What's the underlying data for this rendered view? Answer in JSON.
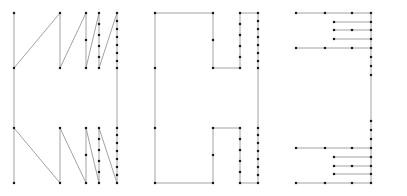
{
  "figure": {
    "title": "",
    "background_color": "#ffffff",
    "edge_color": "#8a8a8a",
    "node_color": "#1a1a1a",
    "node_size": 2.2,
    "edge_width": 0.8,
    "width": 407,
    "height": 196,
    "panel_count": 3
  },
  "chart_data": {
    "type": "scatter",
    "title": "",
    "xlabel": "",
    "ylabel": "",
    "grid": false,
    "legend": null,
    "xlim": [
      0,
      407
    ],
    "ylim": [
      0,
      196
    ],
    "panels": [
      {
        "name": "panel-left",
        "label": "",
        "nodes": [
          [
            14,
            13
          ],
          [
            14,
            68
          ],
          [
            14,
            128
          ],
          [
            14,
            183
          ],
          [
            60,
            13
          ],
          [
            60,
            68
          ],
          [
            60,
            128
          ],
          [
            60,
            183
          ],
          [
            86,
            13
          ],
          [
            86,
            40
          ],
          [
            86,
            68
          ],
          [
            86,
            128
          ],
          [
            86,
            155
          ],
          [
            86,
            183
          ],
          [
            99,
            13
          ],
          [
            99,
            24
          ],
          [
            99,
            35
          ],
          [
            99,
            46
          ],
          [
            99,
            57
          ],
          [
            99,
            68
          ],
          [
            99,
            128
          ],
          [
            99,
            139
          ],
          [
            99,
            150
          ],
          [
            99,
            161
          ],
          [
            99,
            172
          ],
          [
            99,
            183
          ],
          [
            117,
            13
          ],
          [
            117,
            21
          ],
          [
            117,
            29
          ],
          [
            117,
            37
          ],
          [
            117,
            45
          ],
          [
            117,
            53
          ],
          [
            117,
            61
          ],
          [
            117,
            68
          ],
          [
            117,
            128
          ],
          [
            117,
            135
          ],
          [
            117,
            143
          ],
          [
            117,
            151
          ],
          [
            117,
            159
          ],
          [
            117,
            167
          ],
          [
            117,
            175
          ],
          [
            117,
            183
          ]
        ],
        "edges": [
          [
            [
              14,
              13
            ],
            [
              14,
              68
            ]
          ],
          [
            [
              14,
              68
            ],
            [
              60,
              13
            ]
          ],
          [
            [
              60,
              13
            ],
            [
              60,
              68
            ]
          ],
          [
            [
              60,
              68
            ],
            [
              86,
              13
            ]
          ],
          [
            [
              86,
              13
            ],
            [
              86,
              68
            ]
          ],
          [
            [
              86,
              68
            ],
            [
              99,
              13
            ]
          ],
          [
            [
              99,
              13
            ],
            [
              99,
              68
            ]
          ],
          [
            [
              99,
              68
            ],
            [
              117,
              13
            ]
          ],
          [
            [
              117,
              13
            ],
            [
              117,
              68
            ]
          ],
          [
            [
              14,
              68
            ],
            [
              14,
              128
            ]
          ],
          [
            [
              117,
              68
            ],
            [
              117,
              128
            ]
          ],
          [
            [
              14,
              128
            ],
            [
              14,
              183
            ]
          ],
          [
            [
              14,
              128
            ],
            [
              60,
              183
            ]
          ],
          [
            [
              60,
              128
            ],
            [
              60,
              183
            ]
          ],
          [
            [
              60,
              128
            ],
            [
              86,
              183
            ]
          ],
          [
            [
              86,
              128
            ],
            [
              86,
              183
            ]
          ],
          [
            [
              86,
              128
            ],
            [
              99,
              183
            ]
          ],
          [
            [
              99,
              128
            ],
            [
              99,
              183
            ]
          ],
          [
            [
              99,
              128
            ],
            [
              117,
              183
            ]
          ],
          [
            [
              117,
              128
            ],
            [
              117,
              183
            ]
          ]
        ]
      },
      {
        "name": "panel-middle",
        "label": "",
        "nodes": [
          [
            155,
            13
          ],
          [
            155,
            68
          ],
          [
            155,
            128
          ],
          [
            155,
            183
          ],
          [
            213,
            13
          ],
          [
            213,
            40
          ],
          [
            213,
            68
          ],
          [
            213,
            128
          ],
          [
            213,
            155
          ],
          [
            213,
            183
          ],
          [
            240,
            13
          ],
          [
            240,
            24
          ],
          [
            240,
            35
          ],
          [
            240,
            46
          ],
          [
            240,
            57
          ],
          [
            240,
            68
          ],
          [
            240,
            128
          ],
          [
            240,
            139
          ],
          [
            240,
            150
          ],
          [
            240,
            161
          ],
          [
            240,
            172
          ],
          [
            240,
            183
          ],
          [
            258,
            13
          ],
          [
            258,
            21
          ],
          [
            258,
            29
          ],
          [
            258,
            37
          ],
          [
            258,
            45
          ],
          [
            258,
            53
          ],
          [
            258,
            61
          ],
          [
            258,
            68
          ],
          [
            258,
            128
          ],
          [
            258,
            135
          ],
          [
            258,
            143
          ],
          [
            258,
            151
          ],
          [
            258,
            159
          ],
          [
            258,
            167
          ],
          [
            258,
            175
          ],
          [
            258,
            183
          ]
        ],
        "edges": [
          [
            [
              155,
              13
            ],
            [
              213,
              13
            ]
          ],
          [
            [
              155,
              13
            ],
            [
              155,
              68
            ]
          ],
          [
            [
              213,
              13
            ],
            [
              213,
              68
            ]
          ],
          [
            [
              213,
              68
            ],
            [
              240,
              68
            ]
          ],
          [
            [
              240,
              13
            ],
            [
              258,
              13
            ]
          ],
          [
            [
              240,
              13
            ],
            [
              240,
              68
            ]
          ],
          [
            [
              258,
              13
            ],
            [
              258,
              68
            ]
          ],
          [
            [
              155,
              68
            ],
            [
              155,
              128
            ]
          ],
          [
            [
              258,
              68
            ],
            [
              258,
              128
            ]
          ],
          [
            [
              155,
              183
            ],
            [
              213,
              183
            ]
          ],
          [
            [
              155,
              128
            ],
            [
              155,
              183
            ]
          ],
          [
            [
              213,
              128
            ],
            [
              213,
              183
            ]
          ],
          [
            [
              213,
              128
            ],
            [
              240,
              128
            ]
          ],
          [
            [
              240,
              183
            ],
            [
              258,
              183
            ]
          ],
          [
            [
              240,
              128
            ],
            [
              240,
              183
            ]
          ],
          [
            [
              258,
              128
            ],
            [
              258,
              183
            ]
          ]
        ]
      },
      {
        "name": "panel-right",
        "label": "",
        "nodes": [
          [
            296,
            13
          ],
          [
            352,
            13
          ],
          [
            371,
            13
          ],
          [
            325,
            13
          ],
          [
            334,
            22
          ],
          [
            371,
            22
          ],
          [
            352,
            30
          ],
          [
            334,
            30
          ],
          [
            371,
            30
          ],
          [
            334,
            39
          ],
          [
            371,
            39
          ],
          [
            296,
            48
          ],
          [
            325,
            48
          ],
          [
            352,
            48
          ],
          [
            371,
            48
          ],
          [
            296,
            148
          ],
          [
            325,
            148
          ],
          [
            352,
            148
          ],
          [
            371,
            148
          ],
          [
            334,
            157
          ],
          [
            371,
            157
          ],
          [
            352,
            166
          ],
          [
            334,
            166
          ],
          [
            371,
            166
          ],
          [
            334,
            174
          ],
          [
            371,
            174
          ],
          [
            296,
            183
          ],
          [
            325,
            183
          ],
          [
            352,
            183
          ],
          [
            371,
            183
          ],
          [
            371,
            57
          ],
          [
            371,
            66
          ],
          [
            371,
            75
          ],
          [
            371,
            121
          ],
          [
            371,
            130
          ],
          [
            371,
            139
          ]
        ],
        "edges": [
          [
            [
              296,
              13
            ],
            [
              371,
              13
            ]
          ],
          [
            [
              334,
              22
            ],
            [
              371,
              22
            ]
          ],
          [
            [
              334,
              30
            ],
            [
              371,
              30
            ]
          ],
          [
            [
              334,
              39
            ],
            [
              371,
              39
            ]
          ],
          [
            [
              296,
              48
            ],
            [
              371,
              48
            ]
          ],
          [
            [
              371,
              13
            ],
            [
              371,
              48
            ]
          ],
          [
            [
              371,
              48
            ],
            [
              371,
              148
            ]
          ],
          [
            [
              296,
              148
            ],
            [
              371,
              148
            ]
          ],
          [
            [
              334,
              157
            ],
            [
              371,
              157
            ]
          ],
          [
            [
              334,
              166
            ],
            [
              371,
              166
            ]
          ],
          [
            [
              334,
              174
            ],
            [
              371,
              174
            ]
          ],
          [
            [
              296,
              183
            ],
            [
              371,
              183
            ]
          ],
          [
            [
              371,
              148
            ],
            [
              371,
              183
            ]
          ]
        ]
      }
    ]
  }
}
